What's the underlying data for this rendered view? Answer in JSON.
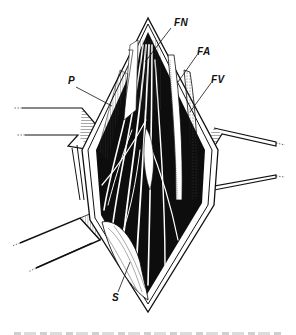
{
  "figure": {
    "type": "anatomical-illustration",
    "labels": [
      {
        "id": "FN",
        "text": "FN",
        "x": 172,
        "y": 20
      },
      {
        "id": "FA",
        "text": "FA",
        "x": 196,
        "y": 50
      },
      {
        "id": "FV",
        "text": "FV",
        "x": 210,
        "y": 78
      },
      {
        "id": "P",
        "text": "P",
        "x": 67,
        "y": 77
      },
      {
        "id": "S",
        "text": "S",
        "x": 114,
        "y": 293
      }
    ],
    "colors": {
      "ink": "#111111",
      "paper": "#ffffff"
    }
  }
}
